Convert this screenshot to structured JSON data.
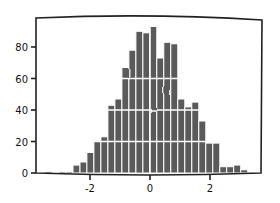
{
  "chart_data": {
    "type": "bar",
    "style": "xkcd histogram",
    "title": "",
    "xlabel": "",
    "ylabel": "",
    "xlim": [
      -3.5,
      3.5
    ],
    "ylim": [
      0,
      96
    ],
    "grid": false,
    "legend": null,
    "x_ticks": [
      -2,
      0,
      2
    ],
    "x_tick_labels": [
      "-2",
      "0",
      "2"
    ],
    "y_ticks": [
      0,
      20,
      40,
      60,
      80
    ],
    "y_tick_labels": [
      "0",
      "20",
      "40",
      "60",
      "80"
    ],
    "bin_width": 0.233,
    "bin_edges_start": -3.5,
    "categories": [
      "-3.38",
      "-3.15",
      "-2.92",
      "-2.68",
      "-2.45",
      "-2.22",
      "-1.98",
      "-1.75",
      "-1.52",
      "-1.28",
      "-1.05",
      "-0.82",
      "-0.58",
      "-0.35",
      "-0.12",
      "0.12",
      "0.35",
      "0.58",
      "0.82",
      "1.05",
      "1.28",
      "1.52",
      "1.75",
      "1.98",
      "2.22",
      "2.45",
      "2.68",
      "2.92",
      "3.15"
    ],
    "values": [
      1,
      0,
      1,
      1,
      5,
      7,
      13,
      20,
      23,
      43,
      47,
      67,
      78,
      90,
      89,
      93,
      73,
      83,
      82,
      47,
      42,
      45,
      33,
      19,
      19,
      4,
      4,
      5,
      2
    ],
    "bar_color": "#5a5a5a",
    "edge_color": "#ffffff"
  }
}
